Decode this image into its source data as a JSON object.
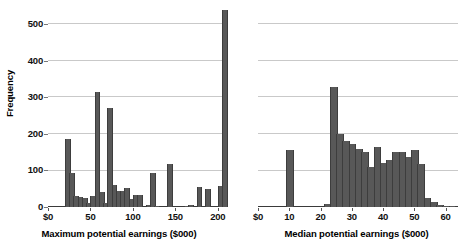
{
  "chart_data": [
    {
      "id": "left",
      "type": "bar",
      "title": "",
      "xlabel": "Maximum potential earnings ($000)",
      "ylabel": "Frequency",
      "xlim": [
        0,
        212
      ],
      "ylim": [
        0,
        545
      ],
      "xticks": [
        0,
        50,
        100,
        150,
        200
      ],
      "xticklabels": [
        "$0",
        "50",
        "100",
        "150",
        "200"
      ],
      "yticks": [
        0,
        100,
        200,
        300,
        400,
        500
      ],
      "yticklabels": [
        "0",
        "100",
        "200",
        "300",
        "400",
        "500"
      ],
      "grid": true,
      "bin_width": 5,
      "bars": [
        {
          "x": 20,
          "value": 185
        },
        {
          "x": 25,
          "value": 92
        },
        {
          "x": 30,
          "value": 30
        },
        {
          "x": 35,
          "value": 28
        },
        {
          "x": 40,
          "value": 26
        },
        {
          "x": 45,
          "value": 12
        },
        {
          "x": 50,
          "value": 31
        },
        {
          "x": 55,
          "value": 315
        },
        {
          "x": 60,
          "value": 41
        },
        {
          "x": 65,
          "value": 10
        },
        {
          "x": 70,
          "value": 270
        },
        {
          "x": 75,
          "value": 61
        },
        {
          "x": 80,
          "value": 45
        },
        {
          "x": 85,
          "value": 43
        },
        {
          "x": 90,
          "value": 52
        },
        {
          "x": 95,
          "value": 21
        },
        {
          "x": 100,
          "value": 33
        },
        {
          "x": 105,
          "value": 34
        },
        {
          "x": 115,
          "value": 5
        },
        {
          "x": 120,
          "value": 93
        },
        {
          "x": 125,
          "value": 4
        },
        {
          "x": 140,
          "value": 119
        },
        {
          "x": 160,
          "value": 2
        },
        {
          "x": 165,
          "value": 5
        },
        {
          "x": 175,
          "value": 54
        },
        {
          "x": 185,
          "value": 48
        },
        {
          "x": 200,
          "value": 57
        },
        {
          "x": 205,
          "value": 540
        }
      ]
    },
    {
      "id": "right",
      "type": "bar",
      "title": "",
      "xlabel": "Median potential earnings ($000)",
      "ylabel": "",
      "xlim": [
        0,
        64
      ],
      "ylim": [
        0,
        545
      ],
      "xticks": [
        0,
        10,
        20,
        30,
        40,
        50,
        60
      ],
      "xticklabels": [
        "$0",
        "10",
        "20",
        "30",
        "40",
        "50",
        "60"
      ],
      "yticks": [
        0,
        100,
        200,
        300,
        400,
        500
      ],
      "grid": true,
      "bin_width": 2,
      "bars": [
        {
          "x": 9,
          "value": 155
        },
        {
          "x": 21,
          "value": 8
        },
        {
          "x": 23,
          "value": 330
        },
        {
          "x": 25,
          "value": 200
        },
        {
          "x": 27,
          "value": 180
        },
        {
          "x": 29,
          "value": 172
        },
        {
          "x": 31,
          "value": 160
        },
        {
          "x": 33,
          "value": 150
        },
        {
          "x": 35,
          "value": 110
        },
        {
          "x": 37,
          "value": 165
        },
        {
          "x": 39,
          "value": 120
        },
        {
          "x": 41,
          "value": 128
        },
        {
          "x": 43,
          "value": 150
        },
        {
          "x": 45,
          "value": 152
        },
        {
          "x": 47,
          "value": 137
        },
        {
          "x": 49,
          "value": 155
        },
        {
          "x": 51,
          "value": 118
        },
        {
          "x": 53,
          "value": 25
        },
        {
          "x": 55,
          "value": 14
        },
        {
          "x": 57,
          "value": 6
        },
        {
          "x": 59,
          "value": 4
        },
        {
          "x": 61,
          "value": 2
        }
      ]
    }
  ]
}
